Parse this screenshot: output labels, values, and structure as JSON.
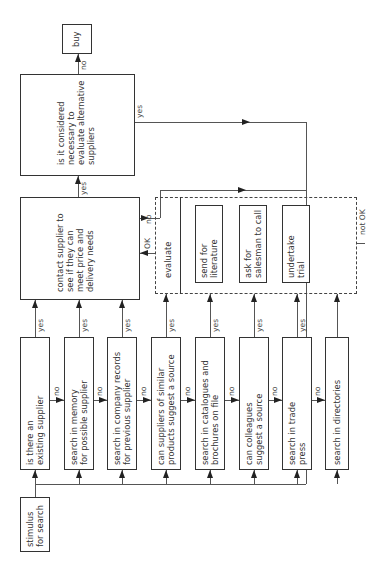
{
  "diagram": {
    "orientation": "rotated-90-ccw",
    "start": {
      "label": "stimulus\nfor search"
    },
    "search_steps": [
      {
        "label": "is there an\nexisting supplier",
        "yes": "yes",
        "no": "no"
      },
      {
        "label": "search in memory\nfor possible supplier",
        "yes": "yes",
        "no": "no"
      },
      {
        "label": "search in company records\nfor previous supplier",
        "yes": "yes",
        "no": "no"
      },
      {
        "label": "can suppliers of similar\nproducts suggest a source",
        "yes": "yes",
        "no": "no"
      },
      {
        "label": "search in catalogues and\nbrochures on file",
        "yes": "yes",
        "no": "no"
      },
      {
        "label": "can colleagues\nsuggest a source",
        "yes": "yes",
        "no": "no"
      },
      {
        "label": "search in trade\npress",
        "yes": "yes",
        "no": "no"
      },
      {
        "label": "search in directories"
      }
    ],
    "contact": {
      "label": "contact supplier to\nsee if they can\nmeet price and\ndelivery needs",
      "yes": "yes",
      "no": "no"
    },
    "evaluate_group": {
      "title": "evaluate",
      "ok": "OK",
      "not_ok": "not OK",
      "actions": [
        {
          "label": "send for\nliterature"
        },
        {
          "label": "ask for\nsalesman to call"
        },
        {
          "label": "undertake\ntrial"
        }
      ]
    },
    "decision": {
      "label": "is it considered\nnecessary to\nevaluate alternative\nsuppliers",
      "yes": "yes",
      "no": "no"
    },
    "end": {
      "label": "buy"
    }
  }
}
